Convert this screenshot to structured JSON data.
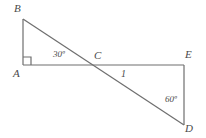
{
  "figure": {
    "type": "geometry-diagram",
    "width": 206,
    "height": 138,
    "background_color": "#ffffff",
    "stroke_color": "#6e6e6e",
    "text_color": "#4a4a4a",
    "vertices": {
      "A": {
        "label": "A",
        "x": 23,
        "y": 65
      },
      "B": {
        "label": "B",
        "x": 23,
        "y": 19
      },
      "C": {
        "label": "C",
        "x": 95,
        "y": 65
      },
      "D": {
        "label": "D",
        "x": 184,
        "y": 125
      },
      "E": {
        "label": "E",
        "x": 184,
        "y": 65
      }
    },
    "segments": [
      {
        "name": "AB",
        "from": "A",
        "to": "B"
      },
      {
        "name": "AE",
        "from": "A",
        "to": "E"
      },
      {
        "name": "BD",
        "from": "B",
        "to": "D"
      },
      {
        "name": "ED",
        "from": "E",
        "to": "D"
      }
    ],
    "right_angle_marker": {
      "at": "A",
      "size": 8
    },
    "angles": [
      {
        "name": "angle-at-A",
        "label": "30º",
        "vertex": "A"
      },
      {
        "name": "angle-at-D",
        "label": "60º",
        "vertex": "D"
      }
    ],
    "side_labels": [
      {
        "name": "segment-CE-length",
        "label": "1",
        "segment": "CE"
      }
    ]
  }
}
